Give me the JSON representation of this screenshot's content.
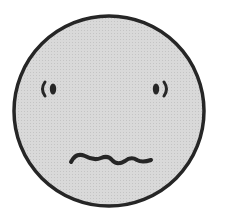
{
  "figure": {
    "expression": "worried / anxious",
    "colors": {
      "background": "#ffffff",
      "face_fill": "#d9d9d9",
      "halftone_dot": "#c4c4c4",
      "outline": "#262626"
    },
    "face": {
      "cx": 109,
      "cy": 111,
      "r": 95,
      "stroke_width": 3.5
    },
    "left_eye": {
      "pupil": {
        "cx": 53,
        "cy": 89,
        "rx": 3.2,
        "ry": 5.5
      },
      "bracket": "M45 82 Q40 89 45 96"
    },
    "right_eye": {
      "pupil": {
        "cx": 156,
        "cy": 89,
        "rx": 3.2,
        "ry": 5.5
      },
      "bracket": "M164 82 Q169 89 164 96"
    },
    "mouth": {
      "path": "M71 162 Q76 152 85 156 Q94 161 101 158 Q108 155 112 160 Q117 166 125 161 Q131 156 137 160 Q142 163 151 160"
    }
  }
}
